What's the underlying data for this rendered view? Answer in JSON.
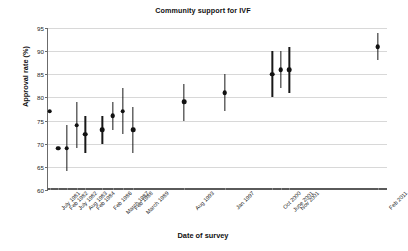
{
  "chart_data": {
    "type": "scatter",
    "title": "Community support for IVF",
    "xlabel": "Date of survey",
    "ylabel": "Approval rate (%)",
    "ylim": [
      60,
      95
    ],
    "yticks": [
      60,
      65,
      70,
      75,
      80,
      85,
      90,
      95
    ],
    "grid": true,
    "legend": "none",
    "categories": [
      "July 1981",
      "Feb 1982",
      "July 1982",
      "Aug 1983",
      "Feb 1984",
      "Feb 1986",
      "March 1987",
      "Feb 1988",
      "March 1989",
      "Aug 1993",
      "Jan 1997",
      "Oct 2000",
      "June 2001",
      "Nov 2001",
      "Feb 2011"
    ],
    "values": [
      77,
      69,
      69,
      74,
      72,
      73,
      76,
      77,
      73,
      79,
      81,
      85,
      86,
      86,
      91
    ],
    "error_low": [
      77,
      69,
      64,
      69,
      68,
      70,
      73,
      72,
      68,
      75,
      77,
      80,
      82,
      81,
      88
    ],
    "error_high": [
      77,
      69,
      74,
      79,
      76,
      76,
      79,
      82,
      78,
      83,
      85,
      90,
      90,
      91,
      94
    ],
    "x_positions": [
      0.5,
      3.0,
      5.5,
      8.5,
      11.0,
      16.0,
      19.0,
      22.0,
      25.0,
      40.0,
      52.0,
      66.0,
      68.5,
      71.0,
      97.0
    ]
  }
}
